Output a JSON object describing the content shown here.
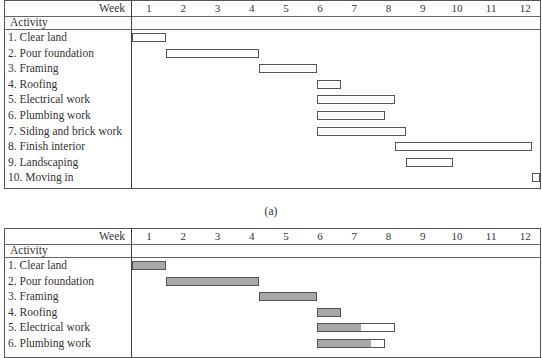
{
  "caption_a": "(a)",
  "week_label": "Week",
  "activity_label": "Activity",
  "weeks": [
    "1",
    "2",
    "3",
    "4",
    "5",
    "6",
    "7",
    "8",
    "9",
    "10",
    "11",
    "12"
  ],
  "activities": [
    "1. Clear land",
    "2. Pour foundation",
    "3. Framing",
    "4. Roofing",
    "5. Electrical work",
    "6. Plumbing work",
    "7. Siding and brick work",
    "8. Finish interior",
    "9. Landscaping",
    "10. Moving in"
  ],
  "chart_data": [
    {
      "type": "gantt",
      "title": "(a)",
      "xlabel": "Week",
      "ylabel": "Activity",
      "x_ticks": [
        1,
        2,
        3,
        4,
        5,
        6,
        7,
        8,
        9,
        10,
        11,
        12
      ],
      "tasks": [
        {
          "name": "1. Clear land",
          "start": 0.5,
          "end": 1.5
        },
        {
          "name": "2. Pour foundation",
          "start": 1.5,
          "end": 4.2
        },
        {
          "name": "3. Framing",
          "start": 4.2,
          "end": 5.9
        },
        {
          "name": "4. Roofing",
          "start": 5.9,
          "end": 6.6
        },
        {
          "name": "5. Electrical work",
          "start": 5.9,
          "end": 8.2
        },
        {
          "name": "6. Plumbing work",
          "start": 5.9,
          "end": 7.9
        },
        {
          "name": "7. Siding and brick work",
          "start": 5.9,
          "end": 8.5
        },
        {
          "name": "8. Finish interior",
          "start": 8.2,
          "end": 12.2
        },
        {
          "name": "9. Landscaping",
          "start": 8.5,
          "end": 9.9
        },
        {
          "name": "10. Moving in",
          "start": 12.2,
          "end": 12.6
        }
      ]
    },
    {
      "type": "gantt",
      "title": "(b)",
      "xlabel": "Week",
      "ylabel": "Activity",
      "x_ticks": [
        1,
        2,
        3,
        4,
        5,
        6,
        7,
        8,
        9,
        10,
        11,
        12
      ],
      "tasks": [
        {
          "name": "1. Clear land",
          "start": 0.5,
          "end": 1.5,
          "completed_to": 1.5
        },
        {
          "name": "2. Pour foundation",
          "start": 1.5,
          "end": 4.2,
          "completed_to": 4.2
        },
        {
          "name": "3. Framing",
          "start": 4.2,
          "end": 5.9,
          "completed_to": 5.9
        },
        {
          "name": "4. Roofing",
          "start": 5.9,
          "end": 6.6,
          "completed_to": 6.6
        },
        {
          "name": "5. Electrical work",
          "start": 5.9,
          "end": 8.2,
          "completed_to": 7.2
        },
        {
          "name": "6. Plumbing work",
          "start": 5.9,
          "end": 7.9,
          "completed_to": 7.5
        }
      ]
    }
  ]
}
